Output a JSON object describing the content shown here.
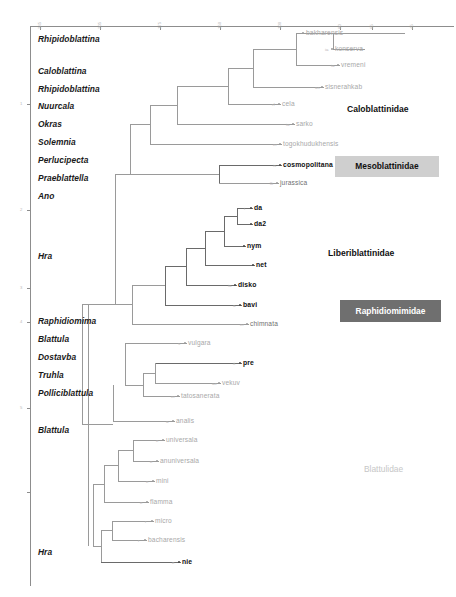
{
  "figure": {
    "type": "phylogenetic-cladogram"
  },
  "axis": {
    "top": {
      "orientation": "horizontal",
      "tick_labels": [
        "245",
        "205",
        "175",
        "150",
        "100",
        "80",
        "65",
        "45"
      ],
      "tick_x": [
        40,
        100,
        160,
        220,
        280,
        340,
        372,
        412
      ]
    },
    "left": {
      "orientation": "vertical",
      "tick_labels": [
        "1",
        "2",
        "3",
        "4",
        "5"
      ],
      "tick_y": [
        104,
        210,
        288,
        322,
        408,
        492
      ]
    }
  },
  "genera": [
    {
      "name": "Rhipidoblattina",
      "y": 40
    },
    {
      "name": "Caloblattina",
      "y": 72
    },
    {
      "name": "Rhipidoblattina",
      "y": 90
    },
    {
      "name": "Nuurcala",
      "y": 107
    },
    {
      "name": "Okras",
      "y": 125
    },
    {
      "name": "Solemnia",
      "y": 143
    },
    {
      "name": "Perlucipecta",
      "y": 161
    },
    {
      "name": "Praeblattella",
      "y": 179
    },
    {
      "name": "Ano",
      "y": 197
    },
    {
      "name": "Hra",
      "y": 257
    },
    {
      "name": "Raphidiomima",
      "y": 322
    },
    {
      "name": "Blattula",
      "y": 340
    },
    {
      "name": "Dostavba",
      "y": 358
    },
    {
      "name": "Truhla",
      "y": 376
    },
    {
      "name": "Polliciblattula",
      "y": 394
    },
    {
      "name": "Blattula",
      "y": 431
    },
    {
      "name": "Hra",
      "y": 553
    }
  ],
  "species": [
    {
      "label": "bakharensis",
      "prefix": "",
      "x": 306,
      "y": 33,
      "style": "faint"
    },
    {
      "label": "konserva",
      "prefix": "ia",
      "x": 335,
      "y": 49,
      "style": "faint"
    },
    {
      "label": "vremeni",
      "prefix": "ia",
      "x": 341,
      "y": 65,
      "style": "faint"
    },
    {
      "label": "sisnerahkab",
      "prefix": "as",
      "x": 325,
      "y": 87,
      "style": "faint"
    },
    {
      "label": "cela",
      "prefix": "rf",
      "x": 282,
      "y": 104,
      "style": "faint"
    },
    {
      "label": "sarko",
      "prefix": "ia",
      "x": 296,
      "y": 124,
      "style": "faint"
    },
    {
      "label": "togokhudukhensis",
      "prefix": "er",
      "x": 283,
      "y": 144,
      "style": "faint"
    },
    {
      "label": "cosmopolitana",
      "prefix": "is",
      "x": 283,
      "y": 165,
      "style": "bold"
    },
    {
      "label": "jurassica",
      "prefix": "lli",
      "x": 280,
      "y": 183,
      "style": "semi"
    },
    {
      "label": "da",
      "prefix": "i",
      "x": 254,
      "y": 208,
      "style": "bold"
    },
    {
      "label": "da2",
      "prefix": "",
      "x": 254,
      "y": 224,
      "style": "bold"
    },
    {
      "label": "nym",
      "prefix": "",
      "x": 247,
      "y": 246,
      "style": "bold"
    },
    {
      "label": "net",
      "prefix": "",
      "x": 256,
      "y": 265,
      "style": "bold"
    },
    {
      "label": "disko",
      "prefix": "ia",
      "x": 238,
      "y": 285,
      "style": "bold"
    },
    {
      "label": "bavi",
      "prefix": "a",
      "x": 243,
      "y": 305,
      "style": "bold"
    },
    {
      "label": "chimnata",
      "prefix": "er",
      "x": 250,
      "y": 324,
      "style": "semi"
    },
    {
      "label": "vulgara",
      "prefix": "s",
      "x": 188,
      "y": 343,
      "style": "faint"
    },
    {
      "label": "pre",
      "prefix": "it",
      "x": 243,
      "y": 363,
      "style": "bold"
    },
    {
      "label": "vekuv",
      "prefix": "ae",
      "x": 222,
      "y": 383,
      "style": "faint"
    },
    {
      "label": "tatosanerata",
      "prefix": "er",
      "x": 181,
      "y": 396,
      "style": "faint"
    },
    {
      "label": "analis",
      "prefix": "a",
      "x": 176,
      "y": 421,
      "style": "faint"
    },
    {
      "label": "universala",
      "prefix": "e",
      "x": 166,
      "y": 440,
      "style": "faint"
    },
    {
      "label": "anuniversala",
      "prefix": "e",
      "x": 160,
      "y": 461,
      "style": "faint"
    },
    {
      "label": "mini",
      "prefix": "e",
      "x": 156,
      "y": 481,
      "style": "faint"
    },
    {
      "label": "flamma",
      "prefix": "e",
      "x": 150,
      "y": 502,
      "style": "faint"
    },
    {
      "label": "micro",
      "prefix": "r",
      "x": 155,
      "y": 521,
      "style": "faint"
    },
    {
      "label": "bacharensis",
      "prefix": "r",
      "x": 148,
      "y": 540,
      "style": "faint"
    },
    {
      "label": "nie",
      "prefix": "e",
      "x": 182,
      "y": 562,
      "style": "bold"
    }
  ],
  "families": [
    {
      "name": "Caloblattinidae",
      "x": 347,
      "y": 110,
      "style": "plain"
    },
    {
      "name": "Mesoblattinidae",
      "x": 335,
      "y": 166,
      "style": "box-light",
      "w": 104,
      "h": 21
    },
    {
      "name": "Liberiblattinidae",
      "x": 328,
      "y": 254,
      "style": "plain"
    },
    {
      "name": "Raphidiomimidae",
      "x": 340,
      "y": 311,
      "style": "box-dark",
      "w": 101,
      "h": 22
    },
    {
      "name": "Blattulidae",
      "x": 364,
      "y": 470,
      "style": "faint"
    }
  ],
  "colors": {
    "branch": "#9a9a9a",
    "branch_dark": "#6a6a6a",
    "axis": "#8d8d8d",
    "text_dark": "#111111",
    "text_faint": "#a8a8a8",
    "box_light": "#cfcfcf",
    "box_dark": "#6f6f6f"
  }
}
